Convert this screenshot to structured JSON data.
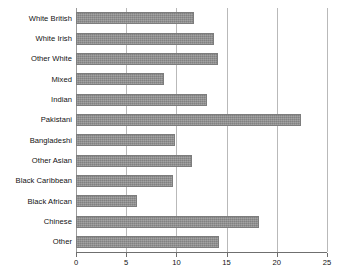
{
  "chart_data": {
    "type": "bar",
    "orientation": "horizontal",
    "title": "",
    "subtitle": "",
    "xlabel": "",
    "ylabel": "",
    "xlim": [
      0,
      25
    ],
    "ylim": null,
    "grid": true,
    "legend": false,
    "legend_position": "none",
    "xticks": [
      0,
      5,
      10,
      15,
      20,
      25
    ],
    "xtick_labels": [
      "0",
      "5",
      "10",
      "15",
      "20",
      "25"
    ],
    "bar_color": "#8e8e8e",
    "bar_edge_color": "#7d7d7d",
    "gridline_color": "#b9b9b9",
    "categories": [
      "White British",
      "White Irish",
      "Other White",
      "Mixed",
      "Indian",
      "Pakistani",
      "Bangladeshi",
      "Other Asian",
      "Black Caribbean",
      "Black African",
      "Chinese",
      "Other"
    ],
    "values": [
      11.8,
      13.7,
      14.1,
      8.8,
      13.0,
      22.4,
      9.9,
      11.6,
      9.7,
      6.1,
      18.2,
      14.2
    ],
    "series": [
      {
        "name": "Percentage",
        "values": [
          11.8,
          13.7,
          14.1,
          8.8,
          13.0,
          22.4,
          9.9,
          11.6,
          9.7,
          6.1,
          18.2,
          14.2
        ]
      }
    ],
    "annotations": []
  }
}
